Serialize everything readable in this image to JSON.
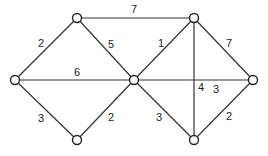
{
  "graph": {
    "nodes": [
      {
        "id": "A",
        "x": 15,
        "y": 80
      },
      {
        "id": "B",
        "x": 77,
        "y": 18
      },
      {
        "id": "C",
        "x": 77,
        "y": 140
      },
      {
        "id": "D",
        "x": 134,
        "y": 80
      },
      {
        "id": "E",
        "x": 194,
        "y": 18
      },
      {
        "id": "F",
        "x": 194,
        "y": 140
      },
      {
        "id": "G",
        "x": 253,
        "y": 80
      }
    ],
    "edges": [
      {
        "from": "A",
        "to": "B",
        "weight": "2",
        "lx": 41,
        "ly": 44
      },
      {
        "from": "B",
        "to": "D",
        "weight": "5",
        "lx": 111,
        "ly": 45
      },
      {
        "from": "A",
        "to": "D",
        "weight": "6",
        "lx": 77,
        "ly": 73
      },
      {
        "from": "B",
        "to": "E",
        "weight": "7",
        "lx": 134,
        "ly": 10
      },
      {
        "from": "A",
        "to": "C",
        "weight": "3",
        "lx": 41,
        "ly": 119
      },
      {
        "from": "C",
        "to": "D",
        "weight": "2",
        "lx": 111,
        "ly": 118
      },
      {
        "from": "D",
        "to": "E",
        "weight": "1",
        "lx": 161,
        "ly": 44
      },
      {
        "from": "E",
        "to": "F",
        "weight": "4",
        "lx": 201,
        "ly": 88
      },
      {
        "from": "E",
        "to": "G",
        "weight": "7",
        "lx": 229,
        "ly": 44
      },
      {
        "from": "D",
        "to": "G",
        "weight": "3",
        "lx": 216,
        "ly": 90
      },
      {
        "from": "D",
        "to": "F",
        "weight": "3",
        "lx": 159,
        "ly": 118
      },
      {
        "from": "F",
        "to": "G",
        "weight": "2",
        "lx": 229,
        "ly": 117
      }
    ]
  }
}
